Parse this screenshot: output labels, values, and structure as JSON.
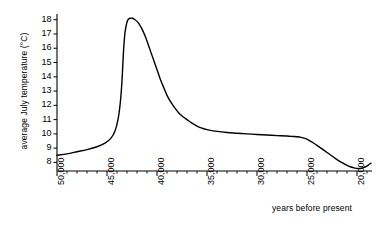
{
  "chart_data": {
    "type": "line",
    "title": "",
    "xlabel": "years before present",
    "ylabel": "average July temperature (°C)",
    "xlim": [
      50000,
      18500
    ],
    "ylim": [
      7.4,
      18.4
    ],
    "x_inverted": true,
    "grid": false,
    "legend": null,
    "x_ticks": [
      "50,000",
      "45,000",
      "40,000",
      "35,000",
      "30,000",
      "25,000",
      "20,000"
    ],
    "x_tick_values": [
      50000,
      45000,
      40000,
      35000,
      30000,
      25000,
      20000
    ],
    "x_minor_tick_step": 1000,
    "y_ticks": [
      "8",
      "9",
      "10",
      "11",
      "12",
      "13",
      "14",
      "15",
      "16",
      "17",
      "18"
    ],
    "y_tick_values": [
      8,
      9,
      10,
      11,
      12,
      13,
      14,
      15,
      16,
      17,
      18
    ],
    "axis_color": "#000000",
    "line_color": "#000000",
    "line_width": 1.4,
    "series": [
      {
        "name": "average July temperature",
        "x": [
          50000,
          49000,
          48000,
          47000,
          46000,
          45200,
          44600,
          44200,
          43900,
          43700,
          43550,
          43450,
          43380,
          43300,
          43200,
          43050,
          42900,
          42700,
          42450,
          42200,
          41950,
          41700,
          41400,
          41100,
          40800,
          40500,
          40200,
          39900,
          39600,
          39300,
          39000,
          38600,
          38200,
          37800,
          37400,
          37000,
          36500,
          36000,
          35500,
          35000,
          34000,
          33000,
          32000,
          31000,
          30000,
          29000,
          28000,
          27000,
          26400,
          26000,
          25600,
          25200,
          24800,
          24400,
          24000,
          23500,
          23000,
          22500,
          22000,
          21500,
          21000,
          20600,
          20200,
          19900,
          19700,
          19500,
          19200,
          18900,
          18600
        ],
        "y": [
          8.5,
          8.6,
          8.75,
          8.9,
          9.1,
          9.35,
          9.7,
          10.2,
          11.0,
          12.0,
          13.2,
          14.4,
          15.4,
          16.3,
          17.1,
          17.7,
          18.0,
          18.1,
          18.1,
          18.0,
          17.85,
          17.6,
          17.2,
          16.7,
          16.1,
          15.5,
          14.9,
          14.3,
          13.7,
          13.2,
          12.7,
          12.2,
          11.8,
          11.45,
          11.2,
          11.0,
          10.75,
          10.55,
          10.4,
          10.3,
          10.18,
          10.1,
          10.05,
          10.0,
          9.96,
          9.92,
          9.88,
          9.85,
          9.82,
          9.8,
          9.76,
          9.68,
          9.55,
          9.38,
          9.2,
          8.95,
          8.7,
          8.45,
          8.2,
          7.98,
          7.8,
          7.68,
          7.6,
          7.57,
          7.57,
          7.6,
          7.68,
          7.8,
          7.95
        ]
      }
    ]
  }
}
